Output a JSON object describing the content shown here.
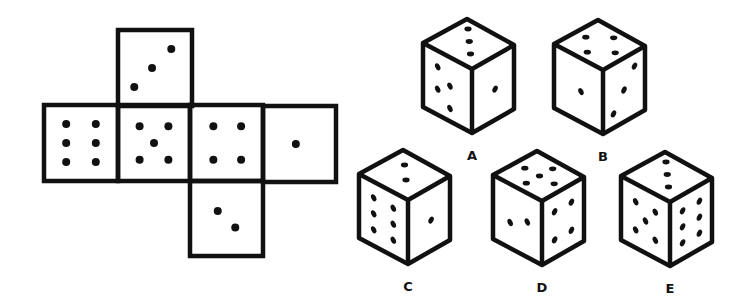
{
  "puzzle": {
    "type": "cube-net-folding",
    "colors": {
      "line": "#111111",
      "pip": "#111111",
      "background": "#ffffff"
    }
  },
  "net": {
    "faces": [
      {
        "id": "top",
        "pips": 3,
        "position": "above second square"
      },
      {
        "id": "left",
        "pips": 6,
        "position": "row col 1"
      },
      {
        "id": "center",
        "pips": 5,
        "position": "row col 2"
      },
      {
        "id": "mid",
        "pips": 4,
        "position": "row col 3"
      },
      {
        "id": "right",
        "pips": 1,
        "position": "row col 4"
      },
      {
        "id": "bottom",
        "pips": 2,
        "position": "below third square"
      }
    ]
  },
  "options": [
    {
      "label": "A",
      "top": 3,
      "left": 4,
      "right": 1
    },
    {
      "label": "B",
      "top": 4,
      "left": 1,
      "right": 3
    },
    {
      "label": "C",
      "top": 2,
      "left": 6,
      "right": 1
    },
    {
      "label": "D",
      "top": 5,
      "left": 2,
      "right": 4
    },
    {
      "label": "E",
      "top": 3,
      "left": 5,
      "right": 6
    }
  ]
}
